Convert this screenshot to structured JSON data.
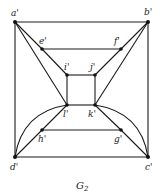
{
  "figure": {
    "caption": "G",
    "caption_subscript": "2"
  },
  "vertices": {
    "a": {
      "label": "a'",
      "x": 15,
      "y": 22
    },
    "b": {
      "label": "b'",
      "x": 148,
      "y": 22
    },
    "c": {
      "label": "c'",
      "x": 148,
      "y": 157
    },
    "d": {
      "label": "d'",
      "x": 15,
      "y": 157
    },
    "e": {
      "label": "e'",
      "x": 42,
      "y": 49
    },
    "f": {
      "label": "f'",
      "x": 121,
      "y": 49
    },
    "i": {
      "label": "i'",
      "x": 67,
      "y": 75
    },
    "j": {
      "label": "j'",
      "x": 95,
      "y": 75
    },
    "l": {
      "label": "l'",
      "x": 67,
      "y": 105
    },
    "k": {
      "label": "k'",
      "x": 95,
      "y": 105
    },
    "h": {
      "label": "h'",
      "x": 42,
      "y": 130
    },
    "g": {
      "label": "g'",
      "x": 121,
      "y": 130
    }
  },
  "edges": [
    [
      "a",
      "b"
    ],
    [
      "b",
      "c"
    ],
    [
      "c",
      "d"
    ],
    [
      "d",
      "a"
    ],
    [
      "a",
      "e"
    ],
    [
      "e",
      "i"
    ],
    [
      "a",
      "l"
    ],
    [
      "b",
      "f"
    ],
    [
      "f",
      "j"
    ],
    [
      "b",
      "k"
    ],
    [
      "e",
      "f"
    ],
    [
      "h",
      "g"
    ],
    [
      "i",
      "j"
    ],
    [
      "j",
      "k"
    ],
    [
      "k",
      "l"
    ],
    [
      "l",
      "i"
    ],
    [
      "d",
      "h"
    ],
    [
      "h",
      "l"
    ],
    [
      "c",
      "g"
    ],
    [
      "g",
      "k"
    ],
    [
      "d",
      "l",
      "curve"
    ],
    [
      "c",
      "k",
      "curve"
    ]
  ]
}
